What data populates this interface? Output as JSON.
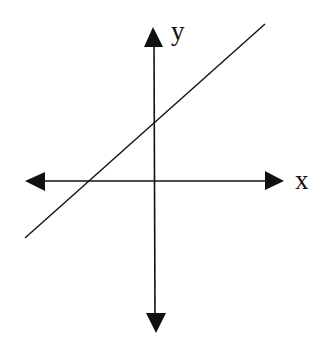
{
  "diagram": {
    "type": "coordinate-plane",
    "x_axis_label": "x",
    "y_axis_label": "y",
    "line": {
      "description": "straight line with positive slope, positive y-intercept and negative x-intercept",
      "color": "#111111"
    },
    "axis_color": "#111111",
    "background": "#ffffff"
  }
}
